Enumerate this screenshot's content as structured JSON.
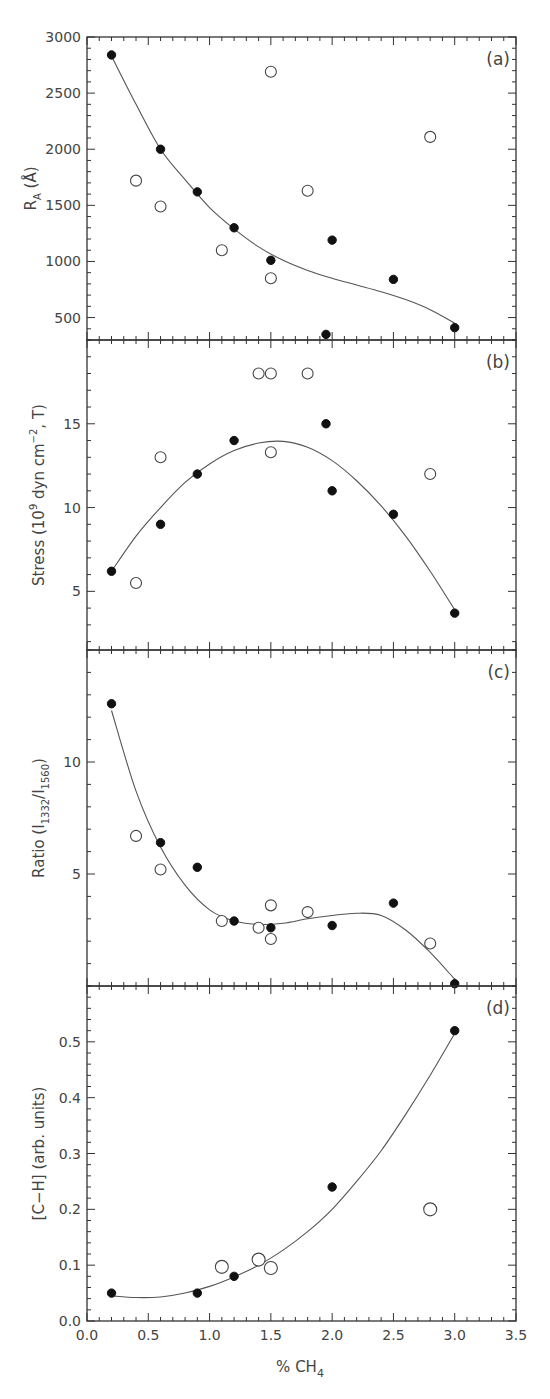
{
  "chart_data": [
    {
      "type": "scatter",
      "panel_label": "(a)",
      "ylabel": "R_A (Å)",
      "ylabel_main": "R",
      "ylabel_sub": "A",
      "ylabel_tail": " (Å)",
      "ylim": [
        300,
        3000
      ],
      "yticks": [
        500,
        1000,
        1500,
        2000,
        2500,
        3000
      ],
      "yminor": 100,
      "series": [
        {
          "name": "filled",
          "marker": "filled-circle",
          "x": [
            0.2,
            0.6,
            0.9,
            1.2,
            1.5,
            1.95,
            2.0,
            2.5,
            3.0
          ],
          "y": [
            2840,
            2000,
            1620,
            1300,
            1010,
            350,
            1190,
            840,
            410
          ]
        },
        {
          "name": "open",
          "marker": "open-circle",
          "x": [
            0.4,
            0.6,
            1.1,
            1.5,
            1.5,
            1.8,
            2.8
          ],
          "y": [
            1720,
            1490,
            1100,
            2690,
            850,
            1630,
            2110
          ]
        }
      ],
      "fit_curve": {
        "x": [
          0.2,
          0.4,
          0.6,
          0.8,
          1.0,
          1.2,
          1.4,
          1.6,
          1.8,
          2.0,
          2.2,
          2.4,
          2.6,
          2.8,
          3.0
        ],
        "y": [
          2830,
          2400,
          2000,
          1730,
          1480,
          1290,
          1130,
          1010,
          920,
          850,
          790,
          730,
          660,
          570,
          450
        ]
      }
    },
    {
      "type": "scatter",
      "panel_label": "(b)",
      "ylabel": "Stress (10^9 dyn cm^-2, T)",
      "ylabel_parts": [
        "Stress  (10",
        "9",
        " dyn cm",
        "−2",
        ", T)"
      ],
      "ylim": [
        1.5,
        20
      ],
      "yticks": [
        5,
        10,
        15
      ],
      "yminor": 1,
      "series": [
        {
          "name": "filled",
          "marker": "filled-circle",
          "x": [
            0.2,
            0.6,
            0.9,
            1.2,
            1.95,
            2.0,
            2.5,
            3.0
          ],
          "y": [
            6.2,
            9.0,
            12.0,
            14.0,
            15.0,
            11.0,
            9.6,
            3.7
          ]
        },
        {
          "name": "open",
          "marker": "open-circle",
          "x": [
            0.4,
            0.6,
            1.4,
            1.5,
            1.5,
            1.8,
            2.8
          ],
          "y": [
            5.5,
            13.0,
            18.0,
            18.0,
            13.3,
            18.0,
            12.0
          ]
        }
      ],
      "fit_curve": {
        "x": [
          0.2,
          0.4,
          0.6,
          0.8,
          1.0,
          1.2,
          1.4,
          1.6,
          1.8,
          2.0,
          2.2,
          2.4,
          2.6,
          2.8,
          3.0
        ],
        "y": [
          6.2,
          8.3,
          10.0,
          11.5,
          12.6,
          13.4,
          13.85,
          13.95,
          13.6,
          12.8,
          11.6,
          10.1,
          8.3,
          6.2,
          3.9
        ]
      }
    },
    {
      "type": "scatter",
      "panel_label": "(c)",
      "ylabel": "Ratio (I_1332/I_1560)",
      "ylabel_parts": [
        "Ratio  (I",
        "1332",
        "/I",
        "1560",
        ")"
      ],
      "ylim": [
        0,
        15
      ],
      "yticks": [
        5,
        10
      ],
      "yminor": 1,
      "series": [
        {
          "name": "filled",
          "marker": "filled-circle",
          "x": [
            0.2,
            0.6,
            0.9,
            1.2,
            1.5,
            2.0,
            2.5,
            3.0
          ],
          "y": [
            12.6,
            6.4,
            5.3,
            2.9,
            2.6,
            2.7,
            3.7,
            0.1
          ]
        },
        {
          "name": "open",
          "marker": "open-circle",
          "x": [
            0.4,
            0.6,
            1.1,
            1.4,
            1.5,
            1.5,
            1.8,
            2.8
          ],
          "y": [
            6.7,
            5.2,
            2.9,
            2.6,
            3.6,
            2.1,
            3.3,
            1.9
          ]
        }
      ],
      "fit_curve": {
        "x": [
          0.2,
          0.4,
          0.6,
          0.8,
          1.0,
          1.2,
          1.4,
          1.6,
          1.8,
          2.0,
          2.2,
          2.4,
          2.6,
          2.8,
          3.0
        ],
        "y": [
          12.3,
          8.7,
          6.2,
          4.5,
          3.4,
          2.9,
          2.75,
          2.8,
          3.0,
          3.15,
          3.25,
          3.15,
          2.5,
          1.5,
          0.3
        ]
      }
    },
    {
      "type": "scatter",
      "panel_label": "(d)",
      "ylabel": "[C−H] (arb. units)",
      "ylim": [
        0,
        0.6
      ],
      "yticks": [
        0.0,
        0.1,
        0.2,
        0.3,
        0.4,
        0.5
      ],
      "ytick_labels": [
        "0.0",
        "0.1",
        "0.2",
        "0.3",
        "0.4",
        "0.5"
      ],
      "yminor": 0.02,
      "series": [
        {
          "name": "filled",
          "marker": "filled-circle",
          "x": [
            0.2,
            0.9,
            1.2,
            2.0,
            3.0
          ],
          "y": [
            0.05,
            0.05,
            0.08,
            0.24,
            0.52
          ]
        },
        {
          "name": "open",
          "marker": "open-circle",
          "x": [
            1.1,
            1.4,
            1.5,
            2.8
          ],
          "y": [
            0.097,
            0.11,
            0.095,
            0.2
          ]
        }
      ],
      "fit_curve": {
        "x": [
          0.2,
          0.4,
          0.6,
          0.8,
          1.0,
          1.2,
          1.4,
          1.6,
          1.8,
          2.0,
          2.2,
          2.4,
          2.6,
          2.8,
          3.0
        ],
        "y": [
          0.045,
          0.042,
          0.043,
          0.05,
          0.062,
          0.079,
          0.1,
          0.127,
          0.16,
          0.2,
          0.25,
          0.305,
          0.37,
          0.44,
          0.515
        ]
      }
    }
  ],
  "shared_x": {
    "xlabel": "% CH4",
    "xlabel_main": "%  CH",
    "xlabel_sub": "4",
    "xlim": [
      0,
      3.5
    ],
    "xticks": [
      0.0,
      0.5,
      1.0,
      1.5,
      2.0,
      2.5,
      3.0,
      3.5
    ],
    "xtick_labels": [
      "0.0",
      "0.5",
      "1.0",
      "1.5",
      "2.0",
      "2.5",
      "3.0",
      "3.5"
    ],
    "xminor": 0.1
  },
  "colors": {
    "ink": "#222222",
    "curve": "#555555",
    "background": "#ffffff"
  }
}
